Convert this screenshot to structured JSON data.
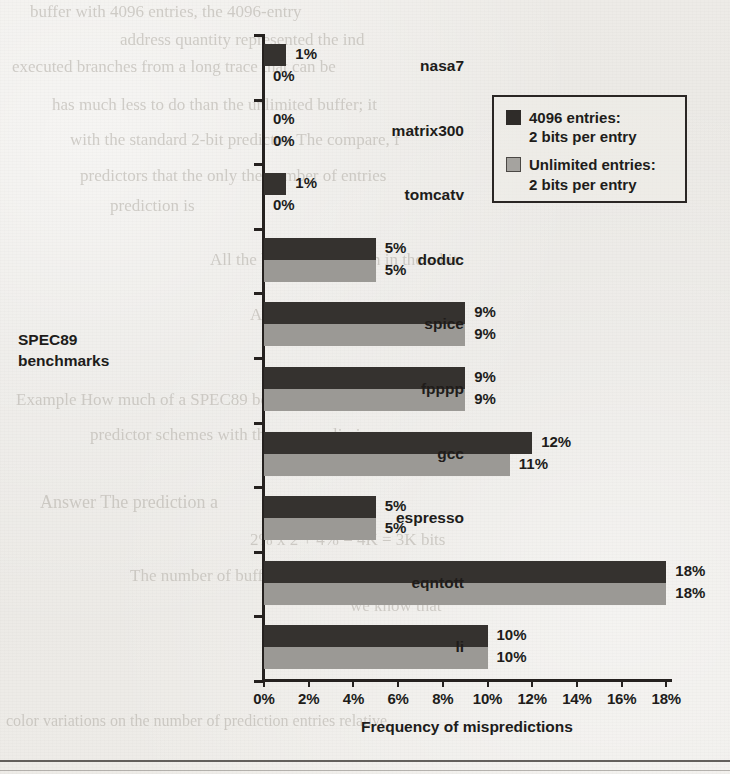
{
  "figure": {
    "y_axis_title": "SPEC89 benchmarks",
    "x_axis_title": "Frequency of mispredictions"
  },
  "legend": {
    "entries": [
      {
        "swatch": "dark-swatch",
        "line1": "4096 entries:",
        "line2": "2 bits per entry"
      },
      {
        "swatch": "light-swatch",
        "line1": "Unlimited entries:",
        "line2": "2 bits per entry"
      }
    ]
  },
  "colors": {
    "series_a": "#35322f",
    "series_b": "#9b9995",
    "axis": "#25211f",
    "paper": "#eceae6"
  },
  "ghost_text": [
    {
      "text": "buffer with 4096 entries, the 4096-entry",
      "x": 30,
      "y": 2,
      "size": 17
    },
    {
      "text": "address quantity represented the ind",
      "x": 120,
      "y": 30,
      "size": 17
    },
    {
      "text": "executed branches from a long trace that can be",
      "x": 12,
      "y": 57,
      "size": 17
    },
    {
      "text": "has much less to do than the unlimited buffer; it",
      "x": 52,
      "y": 95,
      "size": 17
    },
    {
      "text": "with the standard 2-bit predictor. The compare, f",
      "x": 70,
      "y": 130,
      "size": 17
    },
    {
      "text": "predictors that the only the number of entries",
      "x": 80,
      "y": 166,
      "size": 17
    },
    {
      "text": "prediction is",
      "x": 110,
      "y": 196,
      "size": 17
    },
    {
      "text": "All the branch prediction in the s-bit",
      "x": 210,
      "y": 250,
      "size": 17
    },
    {
      "text": "A standard two-bit predictor",
      "x": 250,
      "y": 305,
      "size": 17
    },
    {
      "text": "Example    How much of a SPEC89 benchmark",
      "x": 16,
      "y": 390,
      "size": 17
    },
    {
      "text": "predictor schemes with the same unlimi",
      "x": 90,
      "y": 425,
      "size": 17
    },
    {
      "text": "Answer    The prediction a",
      "x": 40,
      "y": 492,
      "size": 18
    },
    {
      "text": "2% x 2 + 4% = 4K = 3K bits",
      "x": 250,
      "y": 530,
      "size": 17
    },
    {
      "text": "The number of buffer entries are in c-c-c-c",
      "x": 130,
      "y": 566,
      "size": 17
    },
    {
      "text": "we know that",
      "x": 350,
      "y": 596,
      "size": 17
    },
    {
      "text": "n = c",
      "x": 420,
      "y": 625,
      "size": 17
    },
    {
      "text": "color variations on the number of prediction entries relative",
      "x": 6,
      "y": 712,
      "size": 16
    }
  ],
  "chart_data": {
    "type": "bar",
    "orientation": "horizontal",
    "title": "",
    "xlabel": "Frequency of mispredictions",
    "ylabel": "SPEC89 benchmarks",
    "xlim": [
      0,
      18
    ],
    "grid": false,
    "legend_position": "upper-right",
    "categories": [
      "nasa7",
      "matrix300",
      "tomcatv",
      "doduc",
      "spice",
      "fpppp",
      "gcc",
      "espresso",
      "eqntott",
      "li"
    ],
    "series": [
      {
        "name": "4096 entries: 2 bits per entry",
        "color": "#35322f",
        "values": [
          1,
          0,
          1,
          5,
          9,
          9,
          12,
          5,
          18,
          10
        ],
        "labels": [
          "1%",
          "0%",
          "1%",
          "5%",
          "9%",
          "9%",
          "12%",
          "5%",
          "18%",
          "10%"
        ]
      },
      {
        "name": "Unlimited entries: 2 bits per entry",
        "color": "#9b9995",
        "values": [
          0,
          0,
          0,
          5,
          9,
          9,
          11,
          5,
          18,
          10
        ],
        "labels": [
          "0%",
          "0%",
          "0%",
          "5%",
          "9%",
          "9%",
          "11%",
          "5%",
          "18%",
          "10%"
        ]
      }
    ],
    "xticks": [
      0,
      2,
      4,
      6,
      8,
      10,
      12,
      14,
      16,
      18
    ],
    "xtick_labels": [
      "0%",
      "2%",
      "4%",
      "6%",
      "8%",
      "10%",
      "12%",
      "14%",
      "16%",
      "18%"
    ]
  }
}
